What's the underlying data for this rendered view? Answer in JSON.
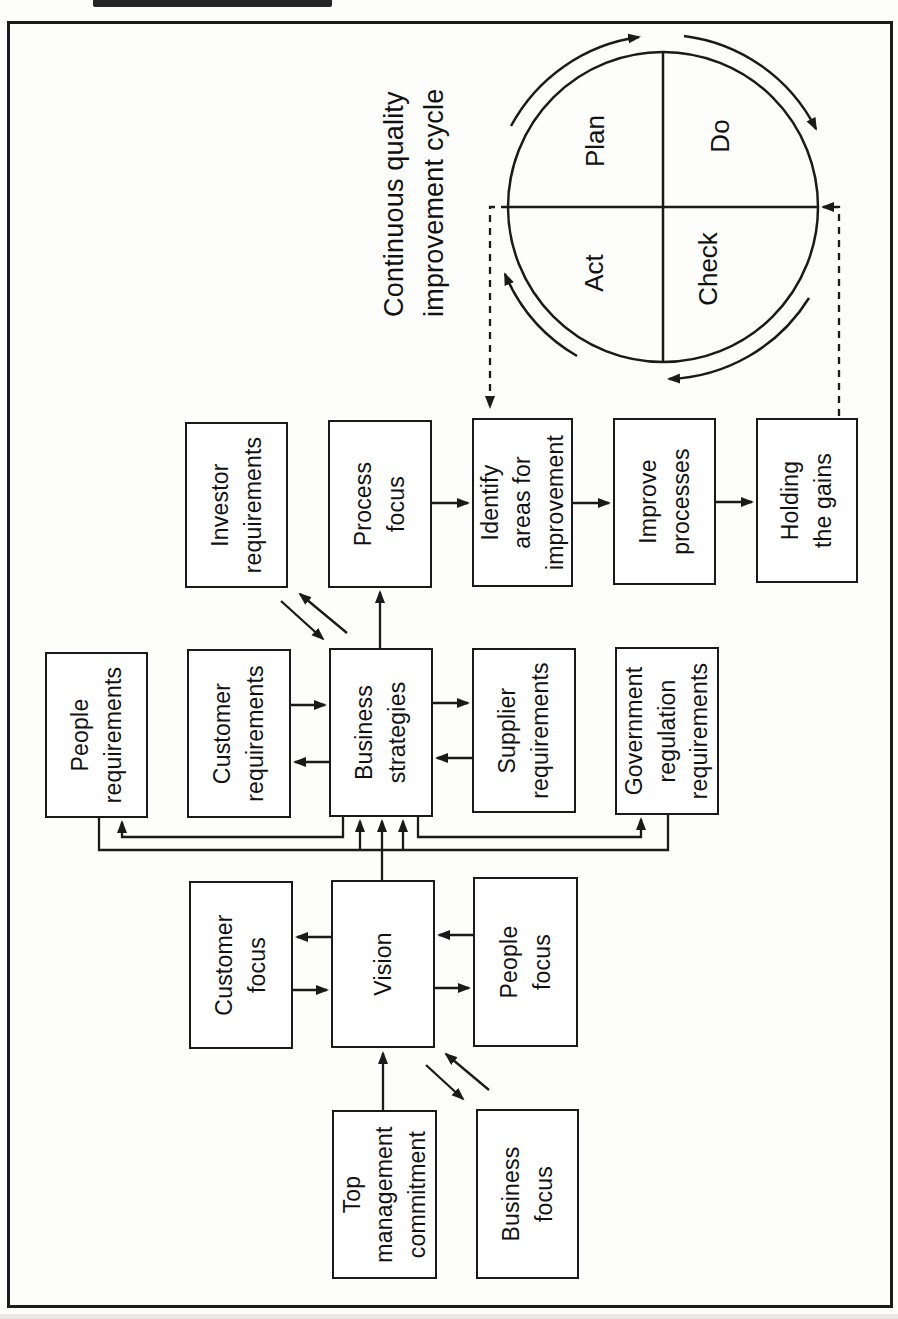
{
  "figure": {
    "kind": "total-quality-management-framework-flowchart",
    "orientation": "rotated-90-degrees",
    "line_color": "#1a1a1a",
    "paper_color": "#fdfdfb"
  },
  "nodes": {
    "top_management_commitment": "Top\nmanagement\ncommitment",
    "business_focus": "Business\nfocus",
    "customer_focus": "Customer\nfocus",
    "vision": "Vision",
    "people_focus": "People\nfocus",
    "people_requirements": "People\nrequirements",
    "customer_requirements": "Customer\nrequirements",
    "business_strategies": "Business\nstrategies",
    "supplier_requirements": "Supplier\nrequirements",
    "government_regulation_requirements": "Government\nregulation\nrequirements",
    "investor_requirements": "Investor\nrequirements",
    "process_focus": "Process\nfocus",
    "identify_areas_for_improvement": "Identify\nareas for\nimprovement",
    "improve_processes": "Improve\nprocesses",
    "holding_the_gains": "Holding\nthe gains"
  },
  "cycle": {
    "title": "Continuous quality\nimprovement cycle",
    "quadrants": {
      "plan": "Plan",
      "do": "Do",
      "check": "Check",
      "act": "Act"
    }
  }
}
